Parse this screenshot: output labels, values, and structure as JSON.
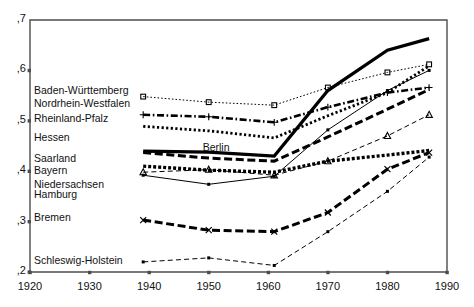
{
  "chart_data": {
    "type": "line",
    "title": "",
    "xlabel": "",
    "ylabel": "",
    "xlim": [
      1920,
      1990
    ],
    "ylim": [
      0.2,
      0.7
    ],
    "xticks": [
      1920,
      1930,
      1940,
      1950,
      1960,
      1970,
      1980,
      1990
    ],
    "xticklabels": [
      "1920",
      "1930",
      "1940",
      "1950",
      "1960",
      "1970",
      "1980",
      "1990"
    ],
    "yticks": [
      0.2,
      0.3,
      0.4,
      0.5,
      0.6,
      0.7
    ],
    "yticklabels": [
      ",2",
      ",3",
      ",4",
      ",5",
      ",6",
      ",7"
    ],
    "grid": false,
    "legend_position": "inline-left",
    "x": [
      1939,
      1950,
      1961,
      1970,
      1980,
      1987
    ],
    "series": [
      {
        "name": "Baden-Württemberg",
        "label": "Baden-Württemberg",
        "values": [
          0.548,
          0.537,
          0.531,
          0.566,
          0.596,
          0.612
        ],
        "style": "dotted-fine",
        "marker": "square",
        "width": 1
      },
      {
        "name": "Nordrhein-Westfalen",
        "label": "Nordrhein-Westfalen",
        "values": [
          0.512,
          0.508,
          0.497,
          0.527,
          0.556,
          0.566
        ],
        "style": "dash-dot",
        "marker": "plus",
        "width": 2.6
      },
      {
        "name": "Rheinland-Pfalz",
        "label": "Rheinland-Pfalz",
        "values": [
          0.489,
          0.48,
          0.466,
          0.51,
          0.556,
          0.609
        ],
        "style": "dotted-heavy",
        "marker": "none",
        "width": 2.8
      },
      {
        "name": "Hessen",
        "label": "Hessen",
        "values": [
          0.437,
          0.426,
          0.42,
          0.468,
          0.523,
          0.562
        ],
        "style": "dashed-heavy",
        "marker": "none",
        "width": 3.0
      },
      {
        "name": "Saarland",
        "label": "Saarland",
        "values": [
          0.41,
          0.402,
          0.398,
          0.42,
          0.432,
          0.441
        ],
        "style": "dotted-square",
        "marker": "none",
        "width": 3.4
      },
      {
        "name": "Bayern",
        "label": "Bayern",
        "values": [
          0.398,
          0.403,
          0.392,
          0.42,
          0.47,
          0.512
        ],
        "style": "dashed-fine",
        "marker": "triangle",
        "width": 1
      },
      {
        "name": "Niedersachsen",
        "label": "Niedersachsen",
        "values": [
          0.392,
          0.374,
          0.39,
          0.482,
          0.56,
          0.6
        ],
        "style": "solid-thin",
        "marker": "dot",
        "width": 1
      },
      {
        "name": "Hamburg",
        "label": "Hamburg",
        "values": [
          0.44,
          0.438,
          0.43,
          0.56,
          0.64,
          0.663
        ],
        "style": "solid-heavy",
        "marker": "none",
        "width": 3.2
      },
      {
        "name": "Bremen",
        "label": "Bremen",
        "values": [
          0.303,
          0.283,
          0.28,
          0.318,
          0.404,
          0.437
        ],
        "style": "dashed-heavy",
        "marker": "x",
        "width": 3.0
      },
      {
        "name": "Schleswig-Holstein",
        "label": "Schleswig-Holstein",
        "values": [
          0.22,
          0.228,
          0.213,
          0.28,
          0.36,
          0.428
        ],
        "style": "dashed-fine",
        "marker": "dot",
        "width": 1
      }
    ],
    "annotations": [
      {
        "text": "Berlin",
        "x": 1952,
        "y": 0.446
      }
    ]
  },
  "left_labels": [
    {
      "text": "Baden-Württemberg",
      "y": 0.56
    },
    {
      "text": "Nordrhein-Westfalen",
      "y": 0.533
    },
    {
      "text": "Rheinland-Pfalz",
      "y": 0.503
    },
    {
      "text": "Hessen",
      "y": 0.466
    },
    {
      "text": "Saarland",
      "y": 0.424
    },
    {
      "text": "Bayern",
      "y": 0.4
    },
    {
      "text": "Niedersachsen",
      "y": 0.373
    },
    {
      "text": "Hamburg",
      "y": 0.353
    },
    {
      "text": "Bremen",
      "y": 0.308
    },
    {
      "text": "Schleswig-Holstein",
      "y": 0.222
    }
  ],
  "colors": {
    "line": "#000000",
    "axis": "#4d4d4d",
    "text": "#111111",
    "background": "#ffffff"
  }
}
